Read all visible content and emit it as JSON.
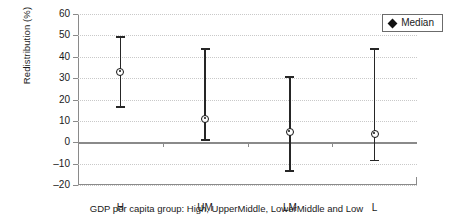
{
  "chart_data": {
    "type": "scatter",
    "title": "",
    "subtitle": "",
    "xlabel": "GDP per capita group: High, UpperMiddle, LowerMiddle and Low",
    "ylabel": "Redistribution (%)",
    "categories": [
      "H",
      "UM",
      "LM",
      "L"
    ],
    "ylim": [
      -20,
      60
    ],
    "yticks": [
      60,
      50,
      40,
      30,
      20,
      10,
      0,
      -10,
      -20
    ],
    "ytick_labels": [
      "60",
      "50",
      "40",
      "30",
      "20",
      "10",
      "0",
      "–10",
      "–20"
    ],
    "grid": true,
    "grid_style": "dotted-horizontal",
    "zero_line": true,
    "legend": {
      "position": "top-right",
      "entries": [
        {
          "label": "Median",
          "marker": "diamond",
          "color": "#111111"
        }
      ]
    },
    "series": [
      {
        "name": "Median",
        "marker": "circle",
        "color": "#111111",
        "points": [
          {
            "category": "H",
            "median": 33,
            "low": 16,
            "high": 49.5
          },
          {
            "category": "UM",
            "median": 11,
            "low": 0.5,
            "high": 44
          },
          {
            "category": "LM",
            "median": 5,
            "low": -14,
            "high": 31
          },
          {
            "category": "L",
            "median": 4,
            "low": -9,
            "high": 44
          }
        ]
      }
    ],
    "error_bar_note": "Vertical whiskers with flat caps span low to high; open circle marks the median."
  },
  "colors": {
    "axis": "#8a8a8a",
    "grid": "#c9c9c9",
    "marker": "#111111",
    "whisker": "#262626",
    "text": "#1a1a1a",
    "background": "#ffffff"
  }
}
